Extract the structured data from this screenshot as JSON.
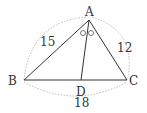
{
  "figure": {
    "vertices": {
      "A": {
        "label": "A",
        "x": 89,
        "y": 20
      },
      "B": {
        "label": "B",
        "x": 24,
        "y": 80
      },
      "C": {
        "label": "C",
        "x": 127,
        "y": 80
      },
      "D": {
        "label": "D",
        "x": 81,
        "y": 80
      }
    },
    "side_lengths": {
      "AB": "15",
      "AC": "12",
      "BC": "18"
    },
    "angle_marks": [
      "○",
      "○"
    ],
    "colors": {
      "line": "#333333",
      "dotted": "#aaaaaa"
    }
  }
}
